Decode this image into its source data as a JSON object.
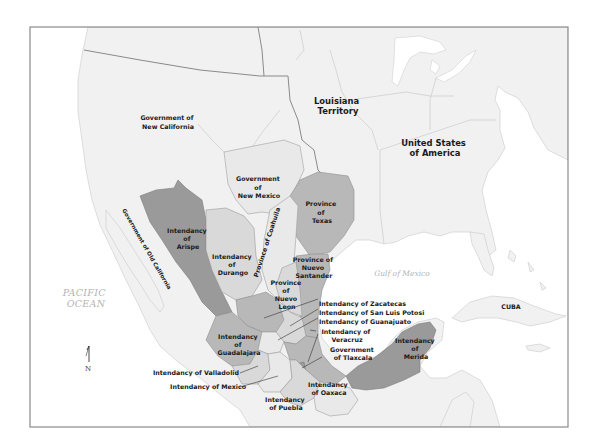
{
  "map": {
    "frame": {
      "x": 30,
      "y": 27,
      "width": 538,
      "height": 400,
      "stroke": "#8a8a8a"
    },
    "colors": {
      "ocean": "#ffffff",
      "land": "#f1f1f1",
      "dark_region": "#9a9a9a",
      "mid_region": "#b8b8b8",
      "light_region": "#d9d9d9",
      "pale_region": "#e9e9e9",
      "ocean_label": "#b4b4b4",
      "label": "#1a1a1a"
    },
    "labels": {
      "new_california": [
        "Government of",
        "New California"
      ],
      "louisiana": [
        "Louisiana",
        "Territory"
      ],
      "usa": [
        "United States",
        "of America"
      ],
      "new_mexico": [
        "Government",
        "of",
        "New Mexico"
      ],
      "texas": [
        "Province",
        "of",
        "Texas"
      ],
      "coahuila": "Province of Coahuila",
      "old_california": "Government of Old California",
      "arispe": [
        "Intendancy",
        "of",
        "Arispe"
      ],
      "durango": [
        "Intendancy",
        "of",
        "Durango"
      ],
      "nuevo_santander": [
        "Province of",
        "Nuevo",
        "Santander"
      ],
      "nuevo_leon": [
        "Province",
        "of",
        "Nuevo",
        "Leon"
      ],
      "zacatecas": "Intendancy of Zacatecas",
      "san_luis_potosi": "Intendancy of San Luis Potosi",
      "guanajuato": "Intendancy of Guanajuato",
      "veracruz": [
        "Intendancy of",
        "Veracruz"
      ],
      "tlaxcala": [
        "Government",
        "of Tlaxcala"
      ],
      "guadalajara": [
        "Intendancy",
        "of",
        "Guadalajara"
      ],
      "merida": [
        "Intendancy",
        "of",
        "Merida"
      ],
      "valladolid": "Intendancy of Valladolid",
      "mexico": "Intendancy of Mexico",
      "oaxaca": [
        "Intendancy",
        "of Oaxaca"
      ],
      "puebla": [
        "Intendancy",
        "of Puebla"
      ],
      "gulf": "Gulf of Mexico",
      "pacific": [
        "PACIFIC",
        "OCEAN"
      ],
      "cuba": "CUBA",
      "north": "N"
    }
  }
}
